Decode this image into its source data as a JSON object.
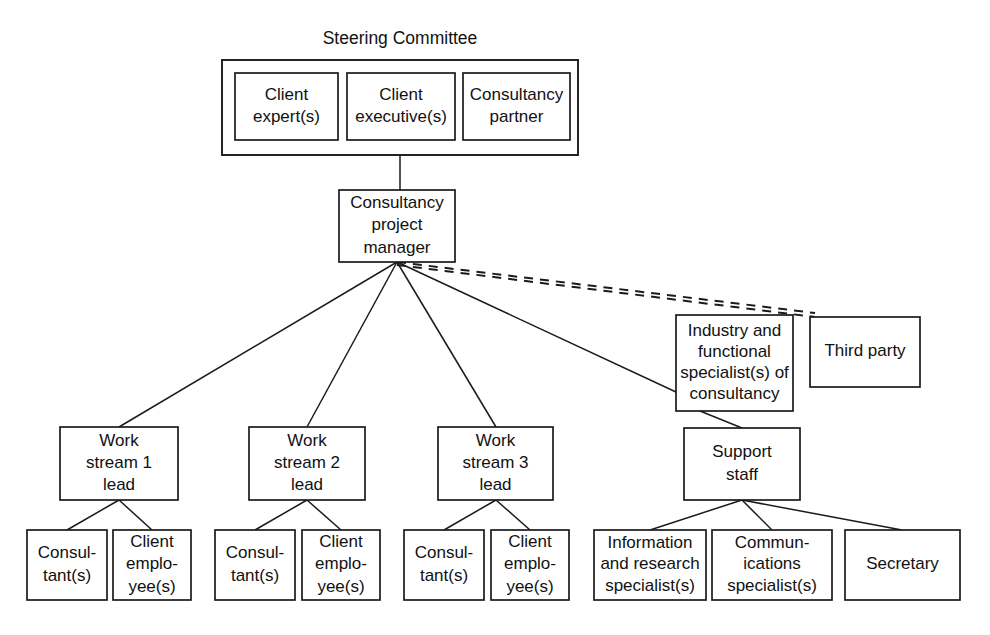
{
  "diagram": {
    "title": "Steering Committee",
    "type": "organizational-chart",
    "canvas": {
      "width": 990,
      "height": 635
    },
    "colors": {
      "stroke": "#1b1b1b",
      "fill": "#ffffff",
      "text": "#111111",
      "background": "#ffffff"
    },
    "groups": [
      {
        "id": "steering-committee",
        "label": "Steering Committee",
        "label_position": "above",
        "box": {
          "x": 222,
          "y": 60,
          "w": 356,
          "h": 95
        }
      }
    ],
    "nodes": [
      {
        "id": "client-expert",
        "lines": [
          "Client",
          "expert(s)"
        ],
        "box": {
          "x": 235,
          "y": 73,
          "w": 103,
          "h": 67
        },
        "font_size": 17
      },
      {
        "id": "client-executive",
        "lines": [
          "Client",
          "executive(s)"
        ],
        "box": {
          "x": 347,
          "y": 73,
          "w": 108,
          "h": 67
        },
        "font_size": 17
      },
      {
        "id": "consultancy-partner",
        "lines": [
          "Consultancy",
          "partner"
        ],
        "box": {
          "x": 463,
          "y": 73,
          "w": 107,
          "h": 67
        },
        "font_size": 17
      },
      {
        "id": "consultancy-project-manager",
        "lines": [
          "Consultancy",
          "project",
          "manager"
        ],
        "box": {
          "x": 339,
          "y": 190,
          "w": 116,
          "h": 72
        },
        "font_size": 17
      },
      {
        "id": "industry-functional-specialist",
        "lines": [
          "Industry and",
          "functional",
          "specialist(s) of",
          "consultancy"
        ],
        "box": {
          "x": 676,
          "y": 315,
          "w": 117,
          "h": 96
        },
        "font_size": 16
      },
      {
        "id": "third-party",
        "lines": [
          "Third party"
        ],
        "box": {
          "x": 810,
          "y": 317,
          "w": 110,
          "h": 70
        },
        "font_size": 17
      },
      {
        "id": "work-stream-1-lead",
        "lines": [
          "Work",
          "stream 1",
          "lead"
        ],
        "box": {
          "x": 60,
          "y": 427,
          "w": 118,
          "h": 73
        },
        "font_size": 17
      },
      {
        "id": "work-stream-2-lead",
        "lines": [
          "Work",
          "stream 2",
          "lead"
        ],
        "box": {
          "x": 249,
          "y": 427,
          "w": 116,
          "h": 73
        },
        "font_size": 17
      },
      {
        "id": "work-stream-3-lead",
        "lines": [
          "Work",
          "stream 3",
          "lead"
        ],
        "box": {
          "x": 438,
          "y": 427,
          "w": 115,
          "h": 73
        },
        "font_size": 17
      },
      {
        "id": "support-staff",
        "lines": [
          "Support",
          "staff"
        ],
        "box": {
          "x": 684,
          "y": 428,
          "w": 116,
          "h": 72
        },
        "font_size": 17
      },
      {
        "id": "consultant-1",
        "lines": [
          "Consul-",
          "tant(s)"
        ],
        "box": {
          "x": 27,
          "y": 530,
          "w": 80,
          "h": 70
        },
        "font_size": 17
      },
      {
        "id": "client-employee-1",
        "lines": [
          "Client",
          "emplo-",
          "yee(s)"
        ],
        "box": {
          "x": 113,
          "y": 530,
          "w": 78,
          "h": 70
        },
        "font_size": 17
      },
      {
        "id": "consultant-2",
        "lines": [
          "Consul-",
          "tant(s)"
        ],
        "box": {
          "x": 215,
          "y": 530,
          "w": 80,
          "h": 70
        },
        "font_size": 17
      },
      {
        "id": "client-employee-2",
        "lines": [
          "Client",
          "emplo-",
          "yee(s)"
        ],
        "box": {
          "x": 302,
          "y": 530,
          "w": 78,
          "h": 70
        },
        "font_size": 17
      },
      {
        "id": "consultant-3",
        "lines": [
          "Consul-",
          "tant(s)"
        ],
        "box": {
          "x": 404,
          "y": 530,
          "w": 80,
          "h": 70
        },
        "font_size": 17
      },
      {
        "id": "client-employee-3",
        "lines": [
          "Client",
          "emplo-",
          "yee(s)"
        ],
        "box": {
          "x": 491,
          "y": 530,
          "w": 78,
          "h": 70
        },
        "font_size": 17
      },
      {
        "id": "information-research-specialist",
        "lines": [
          "Information",
          "and research",
          "specialist(s)"
        ],
        "box": {
          "x": 594,
          "y": 530,
          "w": 112,
          "h": 70
        },
        "font_size": 16.5
      },
      {
        "id": "communications-specialist",
        "lines": [
          "Commun-",
          "ications",
          "specialist(s)"
        ],
        "box": {
          "x": 712,
          "y": 530,
          "w": 120,
          "h": 70
        },
        "font_size": 16.5
      },
      {
        "id": "secretary",
        "lines": [
          "Secretary"
        ],
        "box": {
          "x": 845,
          "y": 530,
          "w": 115,
          "h": 70
        },
        "font_size": 17
      }
    ],
    "edges": [
      {
        "id": "steering-to-pm",
        "style": "solid",
        "points": "400,155 400,190"
      },
      {
        "id": "pm-to-ws1",
        "style": "solid",
        "points": "397,262 119,427"
      },
      {
        "id": "pm-to-ws2",
        "style": "solid",
        "points": "397,262 307,427"
      },
      {
        "id": "pm-to-ws3",
        "style": "solid",
        "points": "397,262 496,427"
      },
      {
        "id": "pm-to-specialist",
        "style": "solid",
        "points": "397,262 676,392"
      },
      {
        "id": "specialist-to-support",
        "style": "solid",
        "points": "700,411 742,428"
      },
      {
        "id": "pm-to-thirdparty-upper",
        "style": "dashed",
        "points": "397,262 815,313"
      },
      {
        "id": "pm-to-thirdparty-lower",
        "style": "dashed",
        "points": "397,265 815,317"
      },
      {
        "id": "ws1-to-consultant",
        "style": "solid",
        "points": "119,500 67,530"
      },
      {
        "id": "ws1-to-employee",
        "style": "solid",
        "points": "119,500 152,530"
      },
      {
        "id": "ws2-to-consultant",
        "style": "solid",
        "points": "307,500 255,530"
      },
      {
        "id": "ws2-to-employee",
        "style": "solid",
        "points": "307,500 341,530"
      },
      {
        "id": "ws3-to-consultant",
        "style": "solid",
        "points": "496,500 444,530"
      },
      {
        "id": "ws3-to-employee",
        "style": "solid",
        "points": "496,500 530,530"
      },
      {
        "id": "support-to-information",
        "style": "solid",
        "points": "742,500 650,530"
      },
      {
        "id": "support-to-communications",
        "style": "solid",
        "points": "742,500 772,530"
      },
      {
        "id": "support-to-secretary",
        "style": "solid",
        "points": "742,500 902,530"
      }
    ]
  }
}
